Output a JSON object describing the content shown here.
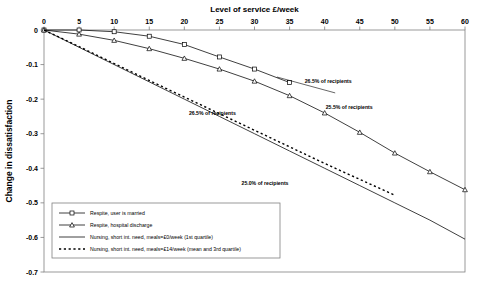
{
  "chart_data": {
    "type": "line",
    "title": "Level of service £/week",
    "xlabel": "Level of service £/week",
    "ylabel": "Change in dissatisfaction",
    "xlim": [
      0,
      60
    ],
    "ylim": [
      -0.7,
      0
    ],
    "xticks": [
      "0",
      "5",
      "10",
      "15",
      "20",
      "25",
      "30",
      "35",
      "40",
      "45",
      "50",
      "55",
      "60"
    ],
    "yticks": [
      "0",
      "-0.1",
      "-0.2",
      "-0.3",
      "-0.4",
      "-0.5",
      "-0.6",
      "-0.7"
    ],
    "grid": false,
    "legend_position": "bottom-left",
    "x": [
      0,
      5,
      10,
      15,
      20,
      25,
      30,
      35,
      40,
      45,
      50,
      55,
      60
    ],
    "series": [
      {
        "name": "Respite, user is married",
        "marker": "square",
        "style": "solid",
        "values": [
          0,
          0,
          -0.005,
          -0.018,
          -0.042,
          -0.078,
          -0.113,
          -0.152,
          null,
          null,
          null,
          null,
          null
        ]
      },
      {
        "name": "Respite, hospital discharge",
        "marker": "triangle",
        "style": "solid",
        "values": [
          0,
          -0.012,
          -0.03,
          -0.054,
          -0.082,
          -0.113,
          -0.148,
          -0.19,
          -0.24,
          -0.296,
          -0.356,
          -0.41,
          -0.462
        ]
      },
      {
        "name": "Nursing, short int. need, meals=£0/week (1st quartile)",
        "marker": "none",
        "style": "solid",
        "values": [
          0,
          -0.05,
          -0.1,
          -0.15,
          -0.2,
          -0.25,
          -0.3,
          -0.35,
          -0.4,
          -0.45,
          -0.5,
          -0.55,
          -0.605
        ]
      },
      {
        "name": "Nursing, short int. need, meals=£14/week (mean and 3rd quartile)",
        "marker": "none",
        "style": "dashed",
        "values": [
          0,
          -0.048,
          -0.097,
          -0.146,
          -0.194,
          -0.242,
          -0.29,
          -0.338,
          -0.386,
          -0.432,
          -0.478,
          null,
          null
        ]
      }
    ],
    "annotations": [
      {
        "text": "26.5% of recipients",
        "x": 40.5,
        "y": -0.152
      },
      {
        "text": "26.5% of recipients",
        "x": 24.0,
        "y": -0.245
      },
      {
        "text": "25.5% of recipients",
        "x": 43.5,
        "y": -0.228
      },
      {
        "text": "25.0% of recipients",
        "x": 31.5,
        "y": -0.448
      }
    ]
  },
  "legend": {
    "items": [
      {
        "label": "Respite, user is married",
        "marker": "square",
        "style": "solid"
      },
      {
        "label": "Respite, hospital discharge",
        "marker": "triangle",
        "style": "solid"
      },
      {
        "label": "Nursing, short int. need, meals=£0/week (1st quartile)",
        "marker": "none",
        "style": "solid"
      },
      {
        "label": "Nursing, short int. need, meals=£14/week (mean and 3rd quartile)",
        "marker": "none",
        "style": "dashed"
      }
    ]
  },
  "colors": {
    "line": "#000000",
    "axis": "#808080",
    "background": "#ffffff"
  }
}
